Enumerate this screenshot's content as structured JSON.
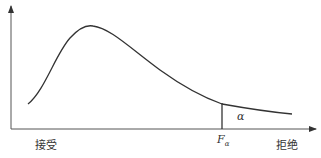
{
  "diagram": {
    "type": "distribution-curve",
    "x_axis": {
      "left_label": "接受",
      "right_label": "拒绝"
    },
    "critical_value": {
      "symbol": "F",
      "subscript": "α"
    },
    "region_label": "α",
    "colors": {
      "line": "#333333",
      "background": "#ffffff"
    }
  }
}
